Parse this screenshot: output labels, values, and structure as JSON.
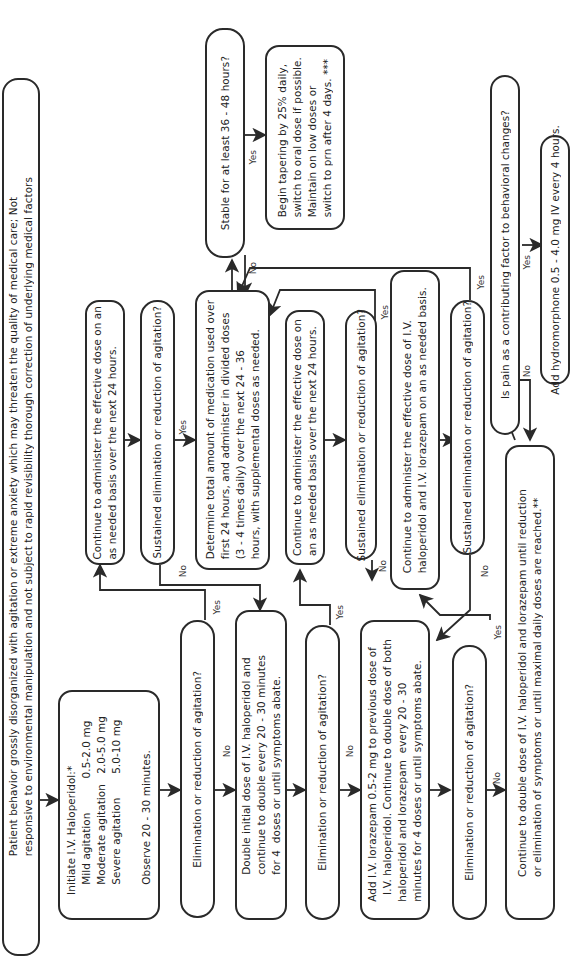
{
  "diagram": {
    "type": "flowchart",
    "orientation": "rotated-90-ccw",
    "nodes": {
      "start": "Patient behavior grossly disorganized with agitation or extreme anxiety which may threaten the quality of medical care; Not\nresponsive to environmental manipulation and not subject to rapid revisibility thorough correction of underlying medical factors",
      "initiate": "Initiate I.V. Haloperidol:*\n   Mild agitation          0.5-2.0 mg\n   Moderate agitation   2.0-5.0 mg\n   Severe agitation       5.0-10 mg\n\n   Observe 20 - 30 minutes.",
      "q1": "Elimination or reduction of agitation?",
      "continue1": "Continue to administer the effective dose on an\nas needed basis over the next 24 hours.",
      "sustained1": "Sustained elimination or reduction of agitation?",
      "double_halo": "Double initial dose of I.V. haloperidol and\ncontinue to double every 20 - 30 minutes\nfor 4  doses or until symptoms abate.",
      "q2": "Elimination or reduction of agitation?",
      "determine": "Determine total amount of medication used over\nfirst 24 hours, and administer in divided doses\n(3 - 4 times daily) over the next 24 - 36\nhours, with supplemental doses as needed.",
      "stable": "Stable for at least 36 - 48 hours?",
      "taper": "Begin tapering by 25% daily,\nswitch to oral dose if possible.\nMaintain on low doses or\nswitch to prn after 4 days. ***",
      "continue2": "Continue to administer the effective dose on\nan as needed basis over the next 24 hours.",
      "sustained2": "Sustained elimination or reduction of agitation?",
      "add_lorazepam": "Add I.V. lorazepam 0.5-2 mg to previous dose of\n  I.V. haloperidol. Continue to double dose of both\nhaloperidol and lorazepam  every 20 - 30\nminutes for 4 doses or until symptoms abate.",
      "continue3": "Continue to administer the effective dose of I.V.\nhaloperidol and I.V. lorazepam on an as needed basis.",
      "sustained3": "Sustained elimination or reduction of agitation?",
      "q3": "Elimination or reduction of agitation?",
      "pain": "Is pain as a contributing factor to behavioral changes?",
      "hydromorphone": "Add hydromorphone 0.5 - 4.0 mg IV every 4 hours.",
      "continue_double": "Continue to double dose of I.V. haloperidol and lorazepam until reduction\nor elimination of symptoms or until maximal daily doses are reached.**"
    },
    "labels": {
      "yes": "Yes",
      "no": "No"
    }
  }
}
